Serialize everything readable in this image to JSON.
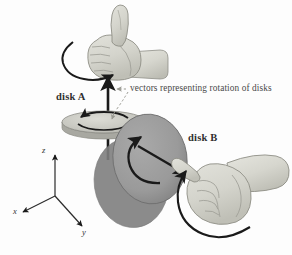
{
  "figure": {
    "background_color": "#fdfdfd"
  },
  "labels": {
    "disk_a": "disk A",
    "disk_b": "disk B",
    "caption": "vectors representing rotation of disks"
  },
  "axes": {
    "z": "z",
    "x": "x",
    "y": "y",
    "origin": [
      55,
      196
    ]
  },
  "disks": [
    {
      "name": "disk A",
      "color": "#c9c9c2",
      "edge_color": "#a9a9a2",
      "orientation": "horizontal",
      "center": [
        104,
        122
      ],
      "rx": 42,
      "ry": 11,
      "vector_direction": "up (+z)",
      "spin_sense": "counterclockwise viewed from above"
    },
    {
      "name": "disk B",
      "color": "#9a9a9a",
      "edge_color": "#7c7c7c",
      "orientation": "vertical",
      "center": [
        152,
        160
      ],
      "rx": 37,
      "ry": 44,
      "vector_direction": "toward lower-right (+y)",
      "spin_sense": "counterclockwise viewed from the front"
    }
  ],
  "hands": [
    {
      "name": "hand-a",
      "pose": "thumbs-up, thumb pointing up",
      "fill": "#d7d7cf",
      "shade": "#bdbdb4",
      "curl_arrow": "counterclockwise around the wrist"
    },
    {
      "name": "hand-b",
      "pose": "fist, thumb pointing up-left toward disk B",
      "fill": "#d7d7cf",
      "shade": "#bdbdb4",
      "curl_arrow": "counterclockwise around the wrist"
    }
  ],
  "colors": {
    "ink": "#1a1a1a",
    "disk_a": "#c9c9c2",
    "disk_b": "#9a9a9a",
    "skin": "#d7d7cf",
    "caption": "#4a4a4a"
  }
}
